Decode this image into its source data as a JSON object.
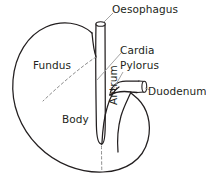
{
  "diagram": {
    "type": "line-drawing",
    "background_color": "#ffffff",
    "stroke_color": "#231f20",
    "leader_line_color": "#9a9a9a",
    "dashed_line_color": "#8c8c8c",
    "labels": {
      "oesophagus": "Oesophagus",
      "cardia": "Cardia",
      "pylorus": "Pylorus",
      "duodenum": "Duodenum",
      "fundus": "Fundus",
      "body": "Body",
      "antrum": "Antrum"
    },
    "parts": [
      {
        "id": "oesophagus",
        "label": "Oesophagus",
        "kind": "tube",
        "orientation": "vertical",
        "has_leader_line": true
      },
      {
        "id": "cardia",
        "label": "Cardia",
        "kind": "region",
        "has_leader_line": true
      },
      {
        "id": "pylorus",
        "label": "Pylorus",
        "kind": "region",
        "has_leader_line": true
      },
      {
        "id": "duodenum",
        "label": "Duodenum",
        "kind": "tube",
        "orientation": "horizontal",
        "has_leader_line": true
      },
      {
        "id": "fundus",
        "label": "Fundus",
        "kind": "region",
        "has_leader_line": false
      },
      {
        "id": "body",
        "label": "Body",
        "kind": "region",
        "has_leader_line": false
      },
      {
        "id": "antrum",
        "label": "Antrum",
        "kind": "region",
        "has_leader_line": false,
        "text_rotation_deg": -90
      }
    ],
    "dashed_dividers": [
      {
        "id": "fundus-body-divider",
        "description": "dashed line separating Fundus from Body"
      },
      {
        "id": "body-antrum-divider",
        "description": "dashed line separating Body from Antrum"
      }
    ]
  }
}
